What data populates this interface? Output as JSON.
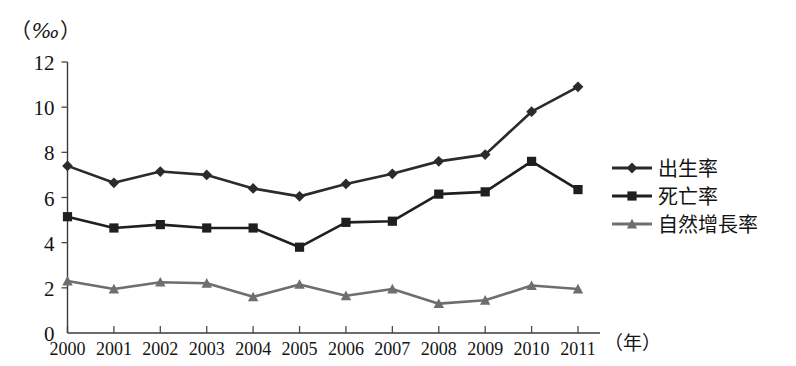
{
  "unit": {
    "open_paren": "（",
    "symbol": "‰",
    "close_paren": "）"
  },
  "chart_data": {
    "type": "line",
    "title": "",
    "xlabel": "（年）",
    "ylabel": "（‰）",
    "ylim": [
      0,
      12
    ],
    "yticks": [
      0,
      2,
      4,
      6,
      8,
      10,
      12
    ],
    "grid": false,
    "legend_position": "right",
    "categories": [
      "2000",
      "2001",
      "2002",
      "2003",
      "2004",
      "2005",
      "2006",
      "2007",
      "2008",
      "2009",
      "2010",
      "2011"
    ],
    "series": [
      {
        "name": "出生率",
        "marker": "diamond",
        "color": "#2b2b2b",
        "values": [
          7.4,
          6.65,
          7.15,
          7.0,
          6.4,
          6.05,
          6.6,
          7.05,
          7.6,
          7.9,
          9.8,
          10.9
        ]
      },
      {
        "name": "死亡率",
        "marker": "square",
        "color": "#1f1f1f",
        "values": [
          5.15,
          4.65,
          4.8,
          4.65,
          4.65,
          3.8,
          4.9,
          4.95,
          6.15,
          6.25,
          7.6,
          6.35
        ]
      },
      {
        "name": "自然增長率",
        "marker": "triangle",
        "color": "#6e6e6e",
        "values": [
          2.3,
          1.95,
          2.25,
          2.2,
          1.6,
          2.15,
          1.65,
          1.95,
          1.3,
          1.45,
          2.1,
          1.95
        ]
      }
    ]
  },
  "legend": {
    "items": [
      {
        "label": "出生率",
        "marker": "diamond",
        "color": "#2b2b2b"
      },
      {
        "label": "死亡率",
        "marker": "square",
        "color": "#1f1f1f"
      },
      {
        "label": "自然增長率",
        "marker": "triangle",
        "color": "#6e6e6e"
      }
    ]
  }
}
